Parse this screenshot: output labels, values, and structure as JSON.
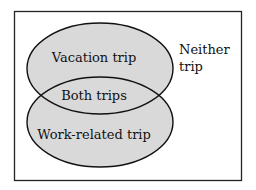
{
  "diagram": {
    "type": "venn",
    "universe_label": "Neither trip",
    "universe_label_lines": [
      "Neither",
      "trip"
    ],
    "sets": [
      {
        "name": "vacation",
        "label": "Vacation trip"
      },
      {
        "name": "work",
        "label": "Work-related trip"
      }
    ],
    "intersection_label": "Both trips",
    "colors": {
      "fill": "#d9d9d9",
      "stroke": "#111111",
      "background": "#ffffff"
    }
  }
}
